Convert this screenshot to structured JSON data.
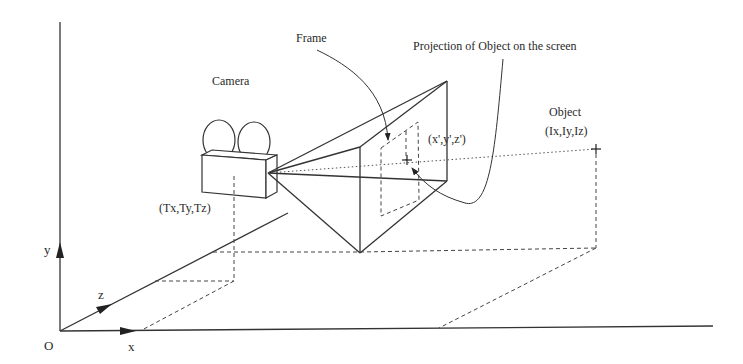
{
  "labels": {
    "frame": "Frame",
    "projection": "Projection of Object on the screen",
    "camera": "Camera",
    "object": "Object",
    "object_coords": "(Ix,Iy,Iz)",
    "camera_coords": "(Tx,Ty,Tz)",
    "projection_coords": "(x',y',z')",
    "origin": "O",
    "axis_x": "x",
    "axis_y": "y",
    "axis_z": "z"
  },
  "colors": {
    "line": "#333333",
    "background": "#ffffff"
  }
}
